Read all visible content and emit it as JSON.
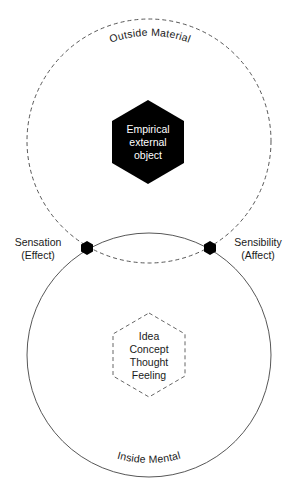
{
  "diagram": {
    "outer_circle": {
      "label": "Outside Material",
      "style": "dashed",
      "center_object": {
        "lines": [
          "Empirical",
          "external",
          "object"
        ],
        "shape": "hexagon-filled",
        "color": "#000000"
      }
    },
    "inner_circle": {
      "label": "Inside Mental",
      "style": "solid",
      "center_object": {
        "lines": [
          "Idea",
          "Concept",
          "Thought",
          "Feeling"
        ],
        "shape": "hexagon-dashed"
      }
    },
    "intersections": {
      "left": {
        "lines": [
          "Sensation",
          "(Effect)"
        ]
      },
      "right": {
        "lines": [
          "Sensibility",
          "(Affect)"
        ]
      }
    },
    "colors": {
      "stroke": "#333333",
      "fill_dark": "#000000",
      "background": "#ffffff"
    }
  }
}
